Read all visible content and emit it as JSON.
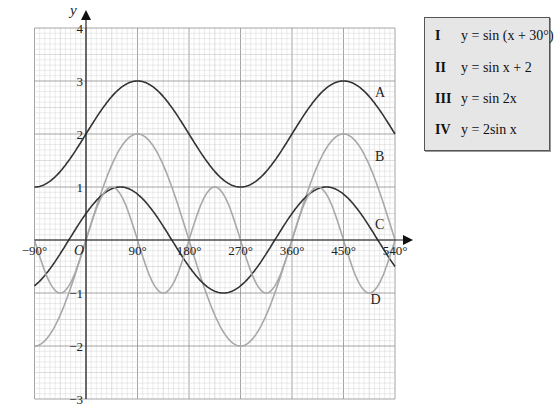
{
  "chart_data": {
    "type": "line",
    "title": "",
    "xlabel": "",
    "ylabel": "y",
    "xlim": [
      -90,
      540
    ],
    "ylim": [
      -3,
      4
    ],
    "grid": true,
    "x_ticks": [
      -90,
      90,
      180,
      270,
      360,
      450,
      540
    ],
    "x_tick_labels": [
      "−90°",
      "90°",
      "180°",
      "270°",
      "360°",
      "450°",
      "540°"
    ],
    "origin_label": "O",
    "y_ticks": [
      -3,
      -2,
      -1,
      1,
      2,
      3,
      4
    ],
    "y_tick_labels": [
      "−3",
      "−2",
      "−1",
      "1",
      "2",
      "3",
      "4"
    ],
    "series": [
      {
        "name": "A",
        "function": "sin x + 2",
        "color": "#333333",
        "label_at": [
          505,
          2.7
        ]
      },
      {
        "name": "B",
        "function": "2 sin x",
        "color": "#a8a8a8",
        "label_at": [
          505,
          1.5
        ]
      },
      {
        "name": "C",
        "function": "sin(x + 30°)",
        "color": "#333333",
        "label_at": [
          505,
          0.2
        ]
      },
      {
        "name": "D",
        "function": "sin 2x",
        "color": "#a8a8a8",
        "label_at": [
          497,
          -1.2
        ]
      }
    ],
    "legend": {
      "position": "right",
      "entries": [
        {
          "num": "I",
          "eq": "y = sin (x + 30°)"
        },
        {
          "num": "II",
          "eq": "y = sin x + 2"
        },
        {
          "num": "III",
          "eq": "y = sin  2x"
        },
        {
          "num": "IV",
          "eq": "y = 2sin x"
        }
      ]
    }
  }
}
